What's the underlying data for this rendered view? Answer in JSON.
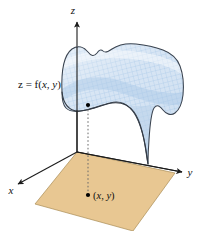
{
  "figure": {
    "type": "3d-surface-diagram",
    "background_color": "#ffffff",
    "width": 204,
    "height": 231,
    "labels": {
      "z_axis": "z",
      "y_axis": "y",
      "x_axis": "x",
      "function_label_prefix": "z = f(",
      "function_label_var1": "x",
      "function_label_comma": ", ",
      "function_label_var2": "y",
      "function_label_suffix": ")",
      "point_label_open": "(",
      "point_label_var1": "x",
      "point_label_comma": ", ",
      "point_label_var2": "y",
      "point_label_close": ")"
    },
    "colors": {
      "surface_fill": "#cfe1f2",
      "surface_mesh": "#8fb8dd",
      "surface_outline": "#333a44",
      "plane_fill": "#e8c792",
      "plane_outline": "#8a7340",
      "axis": "#1b1b1b",
      "dotted_line": "#5b5b5b",
      "point": "#000000"
    },
    "geometry": {
      "origin": [
        77,
        152
      ],
      "z_axis_tip": [
        77,
        18
      ],
      "y_axis_tip": [
        186,
        170
      ],
      "x_axis_tip": [
        14,
        186
      ],
      "plane_corners": [
        [
          77,
          152
        ],
        [
          175,
          173
        ],
        [
          133,
          231
        ],
        [
          35,
          204
        ]
      ],
      "domain_point": [
        88,
        195
      ],
      "surface_point": [
        88,
        105
      ]
    }
  }
}
